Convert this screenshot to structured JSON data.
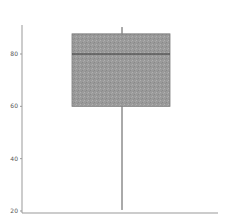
{
  "chart_data": {
    "type": "box",
    "title": "",
    "xlabel": "",
    "ylabel": "",
    "ylim": [
      20,
      92
    ],
    "yticks": [
      20,
      40,
      60,
      80
    ],
    "ytick_labels": [
      "20",
      "40",
      "60",
      "80"
    ],
    "grid": false,
    "legend": null,
    "series": [
      {
        "name": "",
        "whisker_low": 20.4,
        "q1": 60,
        "median": 80,
        "q3": 87.7,
        "whisker_high": 90.3
      }
    ]
  },
  "style": {
    "box_fill": "#9a9a9a",
    "box_stroke": "#7a7a7a",
    "median_color": "#3a3a3a",
    "whisker_color": "#555555",
    "axis_color": "#999999"
  }
}
